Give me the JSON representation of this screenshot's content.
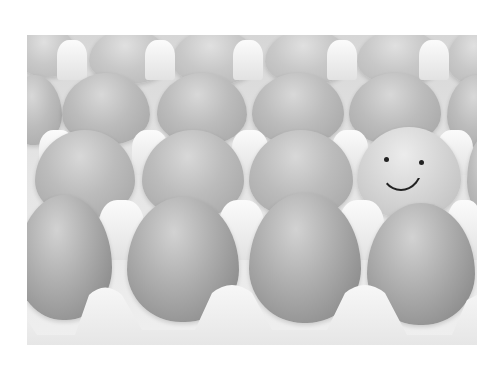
{
  "scene": {
    "description": "Grayscale photo of rows of eggs in a paper egg carton; one egg has a hand-drawn smiley face",
    "colors": {
      "background": "#ffffff",
      "carton": "#eeeeee",
      "egg_light": "#dcdcdc",
      "egg_dark": "#8e8e8e",
      "ink": "#222222"
    },
    "rows": [
      {
        "name": "back-row",
        "count": 6
      },
      {
        "name": "second-row",
        "count": 5
      },
      {
        "name": "third-row",
        "count": 4,
        "smiley_index": 3
      },
      {
        "name": "front-row",
        "count": 4
      }
    ]
  }
}
